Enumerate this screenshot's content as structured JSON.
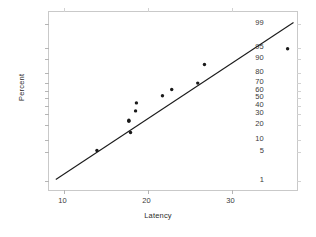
{
  "chart_data": {
    "type": "scatter",
    "title": "",
    "subtitle": "",
    "xlabel": "Latency",
    "ylabel": "Percent",
    "plot_kind": "normal-probability-plot",
    "grid": false,
    "legend": "none",
    "xlim": [
      8.5,
      38.5
    ],
    "ylim_percent": [
      1,
      99.5
    ],
    "xticks": [
      10,
      20,
      30
    ],
    "xtick_labels": [
      "10",
      "20",
      "30"
    ],
    "yticks": [
      1,
      5,
      10,
      20,
      30,
      40,
      50,
      60,
      70,
      80,
      90,
      95,
      99
    ],
    "ytick_labels": [
      "1",
      "5",
      "10",
      "20",
      "30",
      "40",
      "50",
      "60",
      "70",
      "80",
      "90",
      "95",
      "99"
    ],
    "points": [
      {
        "x": 14.1,
        "percent": 5
      },
      {
        "x": 17.9,
        "percent": 23
      },
      {
        "x": 17.9,
        "percent": 22
      },
      {
        "x": 18.1,
        "percent": 14
      },
      {
        "x": 18.7,
        "percent": 32
      },
      {
        "x": 18.8,
        "percent": 42
      },
      {
        "x": 21.9,
        "percent": 51
      },
      {
        "x": 23.0,
        "percent": 60
      },
      {
        "x": 26.1,
        "percent": 68
      },
      {
        "x": 26.9,
        "percent": 85
      },
      {
        "x": 36.8,
        "percent": 94
      }
    ],
    "fit_line": {
      "label": "",
      "x_start": 9.2,
      "percent_start": 1,
      "x_end": 37.5,
      "percent_end": 99.2
    },
    "marker_color": "#1a1a1a",
    "line_color": "#1a1a1a",
    "frame_color": "#c9c9c9",
    "background_color": "#ffffff"
  }
}
